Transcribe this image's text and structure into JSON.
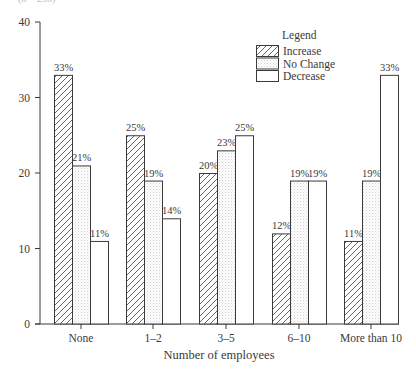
{
  "top_fragment": "(n = 250)",
  "chart_data": {
    "type": "bar",
    "title": "",
    "xlabel": "Number of employees",
    "ylabel": "",
    "ylim": [
      0,
      40
    ],
    "yticks": [
      0,
      10,
      20,
      30,
      40
    ],
    "grid": false,
    "categories": [
      "None",
      "1–2",
      "3–5",
      "6–10",
      "More than 10"
    ],
    "series": [
      {
        "name": "Increase",
        "pattern": "hatch",
        "values": [
          33,
          25,
          20,
          12,
          11
        ],
        "labels": [
          "33%",
          "25%",
          "20%",
          "12%",
          "11%"
        ]
      },
      {
        "name": "No Change",
        "pattern": "dots",
        "values": [
          21,
          19,
          23,
          19,
          19
        ],
        "labels": [
          "21%",
          "19%",
          "23%",
          "19%",
          "19%"
        ]
      },
      {
        "name": "Decrease",
        "pattern": "none",
        "values": [
          11,
          14,
          25,
          19,
          33
        ],
        "labels": [
          "11%",
          "14%",
          "25%",
          "19%",
          "33%"
        ]
      }
    ],
    "legend": {
      "title": "Legend",
      "position": "upper-right",
      "entries": [
        "Increase",
        "No Change",
        "Decrease"
      ]
    },
    "colors": {
      "axis": "#3a3a3a",
      "bar_stroke": "#3a3a3a",
      "bar_fill": "#ffffff",
      "hatch": "#555555",
      "dots": "#c8c8c8"
    }
  }
}
